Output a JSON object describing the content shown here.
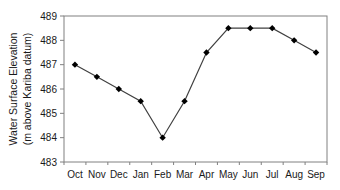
{
  "chart_data": {
    "type": "line",
    "title": "",
    "xlabel": "",
    "ylabel": "Water Surface Elevation",
    "ylabel_line2": "(m above Kariba datum)",
    "categories": [
      "Oct",
      "Nov",
      "Dec",
      "Jan",
      "Feb",
      "Mar",
      "Apr",
      "May",
      "Jun",
      "Jul",
      "Aug",
      "Sep"
    ],
    "series": [
      {
        "name": "Water Surface Elevation",
        "values": [
          487,
          486.5,
          486,
          485.5,
          484,
          485.5,
          487.5,
          488.5,
          488.5,
          488.5,
          488,
          487.5
        ],
        "marker": "diamond",
        "color": "#333333"
      }
    ],
    "ylim": [
      483,
      489
    ],
    "yticks": [
      483,
      484,
      485,
      486,
      487,
      488,
      489
    ],
    "grid": false,
    "legend": "none"
  },
  "colors": {
    "line": "#404040",
    "marker": "#000000",
    "axis": "#808080",
    "text": "#1a1a1a"
  }
}
